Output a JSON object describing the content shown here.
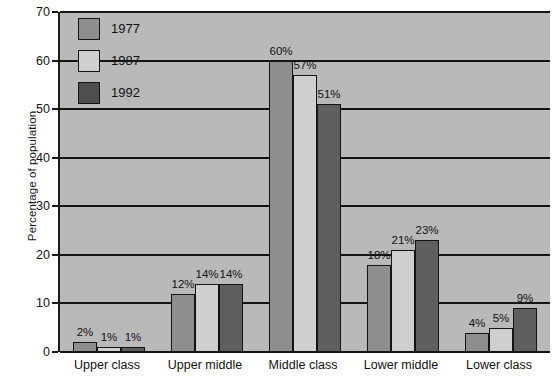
{
  "chart_data": {
    "type": "bar",
    "title": "",
    "xlabel": "",
    "ylabel": "Percentage of population",
    "ylim": [
      0,
      70
    ],
    "ytick_step": 10,
    "yticks": [
      0,
      10,
      20,
      30,
      40,
      50,
      60,
      70
    ],
    "grid": true,
    "legend_position": "top-left-inside",
    "categories": [
      "Upper class",
      "Upper middle",
      "Middle class",
      "Lower middle",
      "Lower class"
    ],
    "series": [
      {
        "name": "1977",
        "color": "#8e8e8e",
        "values": [
          2,
          12,
          60,
          18,
          4
        ],
        "labels": [
          "2%",
          "12%",
          "60%",
          "18%",
          "4%"
        ]
      },
      {
        "name": "1987",
        "color": "#cfcfcf",
        "values": [
          1,
          14,
          57,
          21,
          5
        ],
        "labels": [
          "1%",
          "14%",
          "57%",
          "21%",
          "5%"
        ]
      },
      {
        "name": "1992",
        "color": "#5e5e5e",
        "values": [
          1,
          14,
          51,
          23,
          9
        ],
        "labels": [
          "1%",
          "14%",
          "51%",
          "23%",
          "9%"
        ]
      }
    ]
  },
  "axis": {
    "y_title": "Percentage of population",
    "y_tick_labels": [
      "70",
      "60",
      "50",
      "40",
      "30",
      "20",
      "10",
      "0"
    ]
  },
  "legend": {
    "items": [
      {
        "label": "1977"
      },
      {
        "label": "1987"
      },
      {
        "label": "1992"
      }
    ]
  },
  "colors": {
    "plot_background": "#b9b9b9",
    "page_background": "#ffffff",
    "axis": "#141414",
    "series_1977": "#8e8e8e",
    "series_1987": "#cfcfcf",
    "series_1992": "#5e5e5e"
  }
}
